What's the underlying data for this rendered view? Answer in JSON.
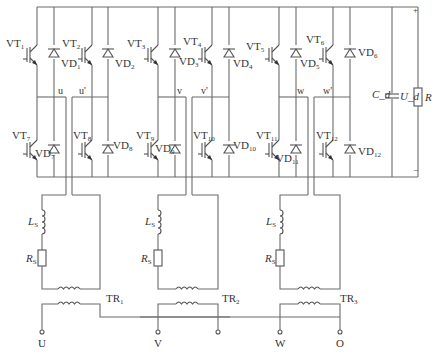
{
  "diagram": {
    "type": "three-phase H-bridge PWM rectifier circuit",
    "dc_link": {
      "capacitor": "C_d",
      "voltage": "U_d",
      "load": "R",
      "positive_label": "+",
      "negative_label": "−"
    },
    "switches_upper": [
      {
        "name": "VT",
        "sub": "1"
      },
      {
        "name": "VT",
        "sub": "2"
      },
      {
        "name": "VT",
        "sub": "3"
      },
      {
        "name": "VT",
        "sub": "4"
      },
      {
        "name": "VT",
        "sub": "5"
      },
      {
        "name": "VT",
        "sub": "6"
      }
    ],
    "diodes_upper": [
      {
        "name": "VD",
        "sub": "1"
      },
      {
        "name": "VD",
        "sub": "2"
      },
      {
        "name": "VD",
        "sub": "3"
      },
      {
        "name": "VD",
        "sub": "4"
      },
      {
        "name": "VD",
        "sub": "5"
      },
      {
        "name": "VD",
        "sub": "6"
      }
    ],
    "switches_lower": [
      {
        "name": "VT",
        "sub": "7"
      },
      {
        "name": "VT",
        "sub": "8"
      },
      {
        "name": "VT",
        "sub": "9"
      },
      {
        "name": "VT",
        "sub": "10"
      },
      {
        "name": "VT",
        "sub": "11"
      },
      {
        "name": "VT",
        "sub": "12"
      }
    ],
    "diodes_lower": [
      {
        "name": "VD",
        "sub": "7"
      },
      {
        "name": "VD",
        "sub": "8"
      },
      {
        "name": "VD",
        "sub": "9"
      },
      {
        "name": "VD",
        "sub": "10"
      },
      {
        "name": "VD",
        "sub": "11"
      },
      {
        "name": "VD",
        "sub": "12"
      }
    ],
    "midpoints": [
      "u",
      "u'",
      "v",
      "v'",
      "w",
      "w'"
    ],
    "phase_branches": [
      {
        "inductor": "L",
        "inductor_sub": "S",
        "resistor": "R",
        "resistor_sub": "S",
        "transformer": "TR",
        "transformer_sub": "1"
      },
      {
        "inductor": "L",
        "inductor_sub": "S",
        "resistor": "R",
        "resistor_sub": "S",
        "transformer": "TR",
        "transformer_sub": "2"
      },
      {
        "inductor": "L",
        "inductor_sub": "S",
        "resistor": "R",
        "resistor_sub": "S",
        "transformer": "TR",
        "transformer_sub": "3"
      }
    ],
    "terminals": [
      "U",
      "V",
      "W",
      "O"
    ]
  }
}
